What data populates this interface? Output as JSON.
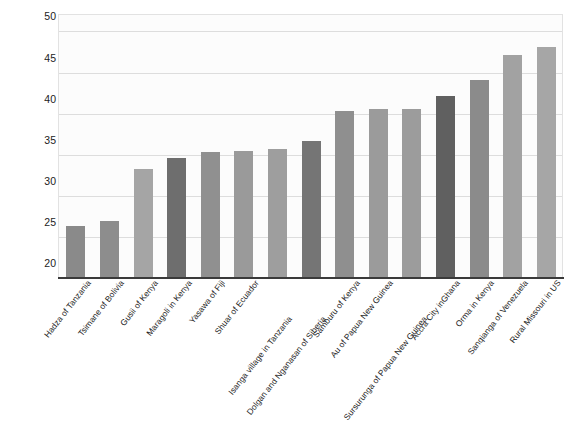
{
  "chart_data": {
    "type": "bar",
    "title": "",
    "xlabel": "",
    "ylabel": "Dictator Game Offers as\nPercentage of Stake",
    "ylim": [
      20,
      52
    ],
    "yticks": [
      20,
      25,
      30,
      35,
      40,
      45,
      50
    ],
    "grid": true,
    "legend": "none",
    "categories": [
      "Hadza of Tanzania",
      "Tsimane of Bolivia",
      "Gusii of Kenya",
      "Maragoli in Kenya",
      "Yasawa of Fiji",
      "Shuar of Ecuador",
      "Isanga village in Tanzania",
      "Dolgan and Nganasan of Siberia",
      "Samburu of Kenya",
      "Au of Papua New Guinea",
      "Sursurunga of Papua New Guinea",
      "Accra City inGhana",
      "Orma in Kenya",
      "Sanqianga of Venezuela",
      "Rural Missouri in US"
    ],
    "values": [
      26.2,
      26.8,
      33.1,
      34.5,
      35.2,
      35.3,
      35.6,
      36.5,
      40.2,
      40.5,
      40.5,
      42.0,
      44.0,
      47.0,
      48.0
    ],
    "bar_colors": [
      "#8a8a8a",
      "#8d8d8d",
      "#a5a5a5",
      "#6e6e6e",
      "#909090",
      "#9a9a9a",
      "#9e9e9e",
      "#757575",
      "#8f8f8f",
      "#9b9b9b",
      "#9c9c9c",
      "#606060",
      "#8b8b8b",
      "#a2a2a2",
      "#a6a6a6"
    ]
  },
  "axis": {
    "y_title": "Dictator Game Offers as\nPercentage of Stake"
  }
}
